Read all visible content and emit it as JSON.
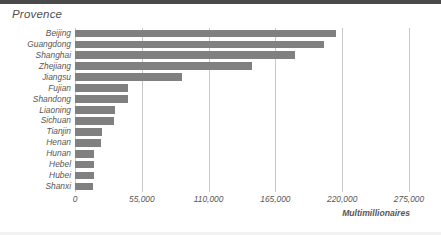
{
  "chart_data": {
    "type": "bar",
    "orientation": "horizontal",
    "title": "Provence",
    "xlabel": "Multimillionaires",
    "ylabel": "",
    "categories": [
      "Beijing",
      "Guangdong",
      "Shanghai",
      "Zhejiang",
      "Jiangsu",
      "Fujian",
      "Shandong",
      "Liaoning",
      "Sichuan",
      "Tianjin",
      "Henan",
      "Hunan",
      "Hebel",
      "Hubei",
      "Shanxi"
    ],
    "values": [
      215000,
      205000,
      181000,
      146000,
      88000,
      44000,
      44000,
      33000,
      32000,
      22000,
      21500,
      16000,
      15700,
      15700,
      15100
    ],
    "xlim": [
      0,
      275000
    ],
    "xticks": [
      0,
      55000,
      110000,
      165000,
      220000,
      275000
    ],
    "xtick_labels": [
      "0",
      "55,000",
      "110,000",
      "165,000",
      "220,000",
      "275,000"
    ],
    "grid": "vertical",
    "legend": null,
    "bar_color": "#808080",
    "gridline_color": "#c9c9c9",
    "text_color": "#575757"
  }
}
